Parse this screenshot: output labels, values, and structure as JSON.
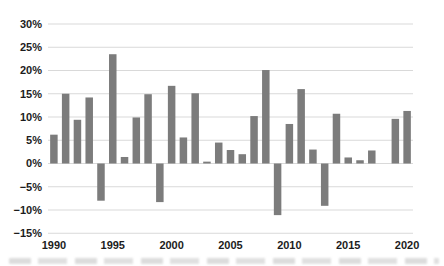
{
  "figure": {
    "background": "#ffffff"
  },
  "chart_data": {
    "type": "bar",
    "title": "",
    "xlabel": "",
    "ylabel": "",
    "unit": "%",
    "x": [
      1990,
      1991,
      1992,
      1993,
      1994,
      1995,
      1996,
      1997,
      1998,
      1999,
      2000,
      2001,
      2002,
      2003,
      2004,
      2005,
      2006,
      2007,
      2008,
      2009,
      2010,
      2011,
      2012,
      2013,
      2014,
      2015,
      2016,
      2017,
      2018,
      2019,
      2020
    ],
    "values": [
      6.2,
      15.0,
      9.4,
      14.2,
      -8.0,
      23.5,
      1.4,
      9.9,
      14.9,
      -8.3,
      16.7,
      5.6,
      15.1,
      0.4,
      4.5,
      2.9,
      2.0,
      10.2,
      20.1,
      -11.1,
      8.5,
      16.0,
      3.0,
      -9.1,
      10.7,
      1.3,
      0.7,
      2.8,
      0.0,
      9.6,
      11.3
    ],
    "ylim": [
      -15,
      30
    ],
    "ytick_step": 5,
    "ytick_labels": [
      "30%",
      "25%",
      "20%",
      "15%",
      "10%",
      "5%",
      "0%",
      "−5%",
      "−10%",
      "−15%"
    ],
    "xtick_years": [
      1990,
      1995,
      2000,
      2005,
      2010,
      2015,
      2020
    ],
    "xtick_labels": [
      "1990",
      "1995",
      "2000",
      "2005",
      "2010",
      "2015",
      "2020"
    ],
    "grid": "horizontal",
    "legend": "none",
    "colors": {
      "bar": "#7c7c7c",
      "gridline": "#d9d9d9",
      "tick_label": "#1c1c1c"
    }
  }
}
